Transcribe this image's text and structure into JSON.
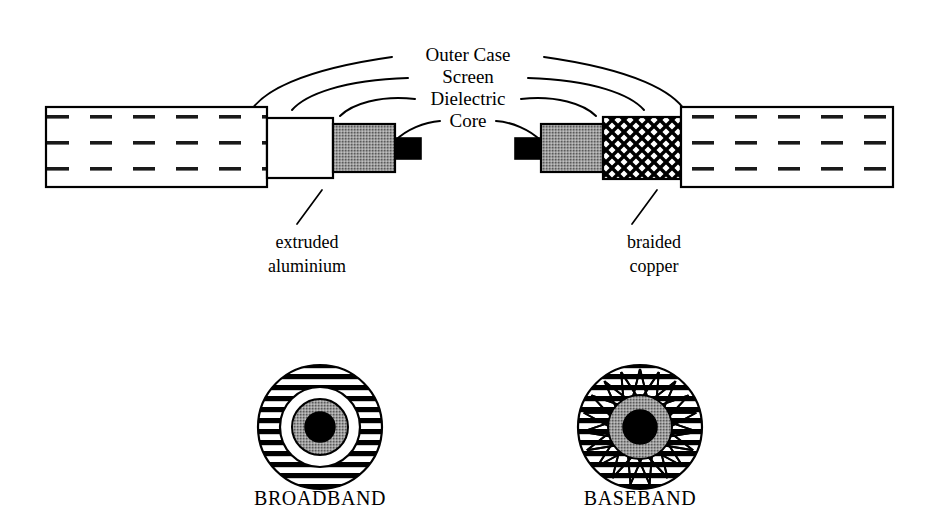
{
  "figure": {
    "callouts": [
      {
        "id": "outer-case",
        "label": "Outer Case"
      },
      {
        "id": "screen",
        "label": "Screen"
      },
      {
        "id": "dielectric",
        "label": "Dielectric"
      },
      {
        "id": "core",
        "label": "Core"
      }
    ],
    "annotations": [
      {
        "id": "left-annotation",
        "line1": "extruded",
        "line2": "aluminium"
      },
      {
        "id": "right-annotation",
        "line1": "braided",
        "line2": "copper"
      }
    ],
    "cross_sections": [
      {
        "id": "broadband",
        "caption": "BROADBAND",
        "screen_style": "horizontal-stripes"
      },
      {
        "id": "baseband",
        "caption": "BASEBAND",
        "screen_style": "horizontal-stripes-with-braid"
      }
    ],
    "colors": {
      "ink": "#000000",
      "paper": "#ffffff",
      "dielectric_gray": "#9a9a9a",
      "core_black": "#000000"
    }
  }
}
